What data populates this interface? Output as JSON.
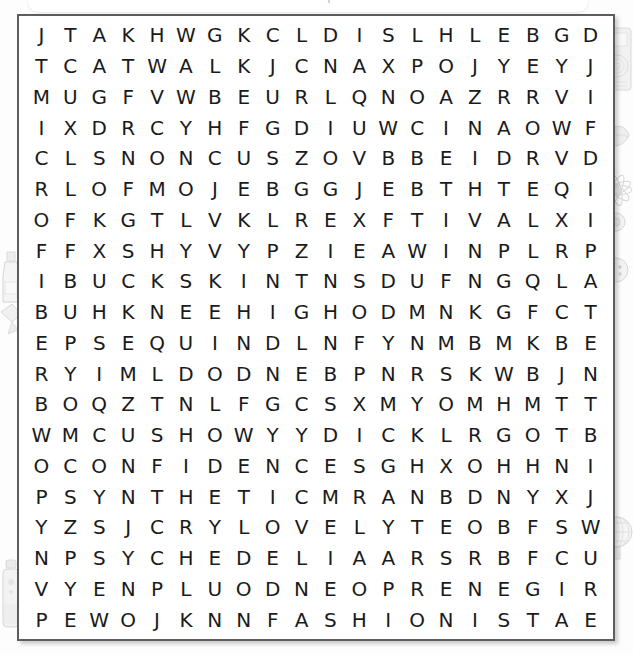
{
  "page": {
    "header_clipped_text": "word search puzzle",
    "background_color": "#fdfdfd",
    "frame_border_color": "#5d5d5d",
    "letter_color": "#1b1b1b"
  },
  "puzzle": {
    "rows": 20,
    "cols": 20,
    "grid": [
      [
        "J",
        "T",
        "A",
        "K",
        "H",
        "W",
        "G",
        "K",
        "C",
        "L",
        "D",
        "I",
        "S",
        "L",
        "H",
        "L",
        "E",
        "B",
        "G",
        "D"
      ],
      [
        "T",
        "C",
        "A",
        "T",
        "W",
        "A",
        "L",
        "K",
        "J",
        "C",
        "N",
        "A",
        "X",
        "P",
        "O",
        "J",
        "Y",
        "E",
        "Y",
        "J"
      ],
      [
        "M",
        "U",
        "G",
        "F",
        "V",
        "W",
        "B",
        "E",
        "U",
        "R",
        "L",
        "Q",
        "N",
        "O",
        "A",
        "Z",
        "R",
        "R",
        "V",
        "I"
      ],
      [
        "I",
        "X",
        "D",
        "R",
        "C",
        "Y",
        "H",
        "F",
        "G",
        "D",
        "I",
        "U",
        "W",
        "C",
        "I",
        "N",
        "A",
        "O",
        "W",
        "F"
      ],
      [
        "C",
        "L",
        "S",
        "N",
        "O",
        "N",
        "C",
        "U",
        "S",
        "Z",
        "O",
        "V",
        "B",
        "B",
        "E",
        "I",
        "D",
        "R",
        "V",
        "D"
      ],
      [
        "R",
        "L",
        "O",
        "F",
        "M",
        "O",
        "J",
        "E",
        "B",
        "G",
        "G",
        "J",
        "E",
        "B",
        "T",
        "H",
        "T",
        "E",
        "Q",
        "I"
      ],
      [
        "O",
        "F",
        "K",
        "G",
        "T",
        "L",
        "V",
        "K",
        "L",
        "R",
        "E",
        "X",
        "F",
        "T",
        "I",
        "V",
        "A",
        "L",
        "X",
        "I"
      ],
      [
        "F",
        "F",
        "X",
        "S",
        "H",
        "Y",
        "V",
        "Y",
        "P",
        "Z",
        "I",
        "E",
        "A",
        "W",
        "I",
        "N",
        "P",
        "L",
        "R",
        "P"
      ],
      [
        "I",
        "B",
        "U",
        "C",
        "K",
        "S",
        "K",
        "I",
        "N",
        "T",
        "N",
        "S",
        "D",
        "U",
        "F",
        "N",
        "G",
        "Q",
        "L",
        "A"
      ],
      [
        "B",
        "U",
        "H",
        "K",
        "N",
        "E",
        "E",
        "H",
        "I",
        "G",
        "H",
        "O",
        "D",
        "M",
        "N",
        "K",
        "G",
        "F",
        "C",
        "T"
      ],
      [
        "E",
        "P",
        "S",
        "E",
        "Q",
        "U",
        "I",
        "N",
        "D",
        "L",
        "N",
        "F",
        "Y",
        "N",
        "M",
        "B",
        "M",
        "K",
        "B",
        "E"
      ],
      [
        "R",
        "Y",
        "I",
        "M",
        "L",
        "D",
        "O",
        "D",
        "N",
        "E",
        "B",
        "P",
        "N",
        "R",
        "S",
        "K",
        "W",
        "B",
        "J",
        "N"
      ],
      [
        "B",
        "O",
        "Q",
        "Z",
        "T",
        "N",
        "L",
        "F",
        "G",
        "C",
        "S",
        "X",
        "M",
        "Y",
        "O",
        "M",
        "H",
        "M",
        "T",
        "T"
      ],
      [
        "W",
        "M",
        "C",
        "U",
        "S",
        "H",
        "O",
        "W",
        "Y",
        "Y",
        "D",
        "I",
        "C",
        "K",
        "L",
        "R",
        "G",
        "O",
        "T",
        "B"
      ],
      [
        "O",
        "C",
        "O",
        "N",
        "F",
        "I",
        "D",
        "E",
        "N",
        "C",
        "E",
        "S",
        "G",
        "H",
        "X",
        "O",
        "H",
        "H",
        "N",
        "I"
      ],
      [
        "P",
        "S",
        "Y",
        "N",
        "T",
        "H",
        "E",
        "T",
        "I",
        "C",
        "M",
        "R",
        "A",
        "N",
        "B",
        "D",
        "N",
        "Y",
        "X",
        "J"
      ],
      [
        "Y",
        "Z",
        "S",
        "J",
        "C",
        "R",
        "Y",
        "L",
        "O",
        "V",
        "E",
        "L",
        "Y",
        "T",
        "E",
        "O",
        "B",
        "F",
        "S",
        "W"
      ],
      [
        "N",
        "P",
        "S",
        "Y",
        "C",
        "H",
        "E",
        "D",
        "E",
        "L",
        "I",
        "A",
        "A",
        "R",
        "S",
        "R",
        "B",
        "F",
        "C",
        "U"
      ],
      [
        "V",
        "Y",
        "E",
        "N",
        "P",
        "L",
        "U",
        "O",
        "D",
        "N",
        "E",
        "O",
        "P",
        "R",
        "E",
        "N",
        "E",
        "G",
        "I",
        "R"
      ],
      [
        "P",
        "E",
        "W",
        "O",
        "J",
        "K",
        "N",
        "N",
        "F",
        "A",
        "S",
        "H",
        "I",
        "O",
        "N",
        "I",
        "S",
        "T",
        "A",
        "E"
      ]
    ]
  },
  "decorations": [
    {
      "name": "radio-illustration",
      "side": "right",
      "top": 22
    },
    {
      "name": "leaf-illustration",
      "side": "right",
      "top": 120
    },
    {
      "name": "flower-illustration",
      "side": "right",
      "top": 175
    },
    {
      "name": "button-illustration",
      "side": "right",
      "top": 250
    },
    {
      "name": "globe-illustration",
      "side": "right",
      "top": 500
    },
    {
      "name": "bottle-illustration",
      "side": "left",
      "top": 255
    },
    {
      "name": "ribbon-illustration",
      "side": "left",
      "top": 300
    },
    {
      "name": "spray-illustration",
      "side": "left",
      "top": 560
    }
  ]
}
